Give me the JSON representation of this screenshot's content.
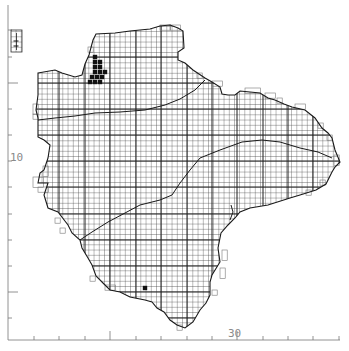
{
  "map": {
    "title": "Devon distribution map",
    "grid_cell_px": 5.2,
    "major_every": 5,
    "colors": {
      "background": "#ffffff",
      "grid": "#3a3a3a",
      "grid_major": "#1e1e1e",
      "coast": "#1a1a1a",
      "record": "#111111",
      "axis": "#777777",
      "axis_label": "#8a8a8a"
    }
  },
  "axes": {
    "y_label": "10",
    "x_label": "30",
    "y_ticks_px": [
      30,
      57,
      83,
      109,
      135,
      161,
      187,
      214,
      240,
      266,
      292,
      318
    ],
    "y_major_px": [
      83,
      292
    ],
    "x_ticks_px": [
      34,
      59,
      85,
      110,
      136,
      161,
      187,
      212,
      237,
      263,
      288,
      313,
      339
    ],
    "x_major_px": [
      110,
      237
    ]
  },
  "inset": {
    "name": "Lundy",
    "x": 11,
    "y": 30,
    "w": 11,
    "h": 22
  },
  "records": {
    "filled_squares": [
      [
        95,
        57
      ],
      [
        95,
        62
      ],
      [
        100,
        62
      ],
      [
        95,
        67
      ],
      [
        100,
        67
      ],
      [
        95,
        72
      ],
      [
        100,
        72
      ],
      [
        105,
        72
      ],
      [
        92,
        77
      ],
      [
        97,
        77
      ],
      [
        102,
        77
      ],
      [
        90,
        82
      ],
      [
        95,
        82
      ],
      [
        100,
        82
      ],
      [
        145,
        288
      ]
    ],
    "lundy_marks": [
      [
        16,
        41
      ],
      [
        16,
        46
      ]
    ]
  }
}
